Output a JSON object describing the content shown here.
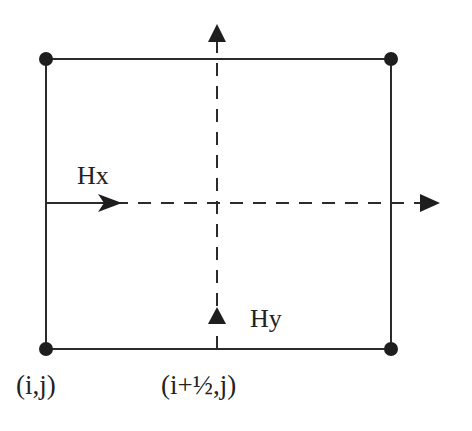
{
  "diagram": {
    "type": "yee-cell-grid",
    "labels": {
      "hx": "Hx",
      "hy": "Hy",
      "node_ij": "(i,j)",
      "node_half": "(i+½,j)"
    },
    "colors": {
      "line": "#2b2b2b",
      "node": "#1e1e1e",
      "text": "#222222",
      "background": "#ffffff"
    },
    "nodes": [
      {
        "name": "top-left",
        "x": 46,
        "y": 59
      },
      {
        "name": "top-right",
        "x": 391,
        "y": 59
      },
      {
        "name": "bottom-left",
        "x": 46,
        "y": 349
      },
      {
        "name": "bottom-right",
        "x": 391,
        "y": 349
      }
    ]
  }
}
